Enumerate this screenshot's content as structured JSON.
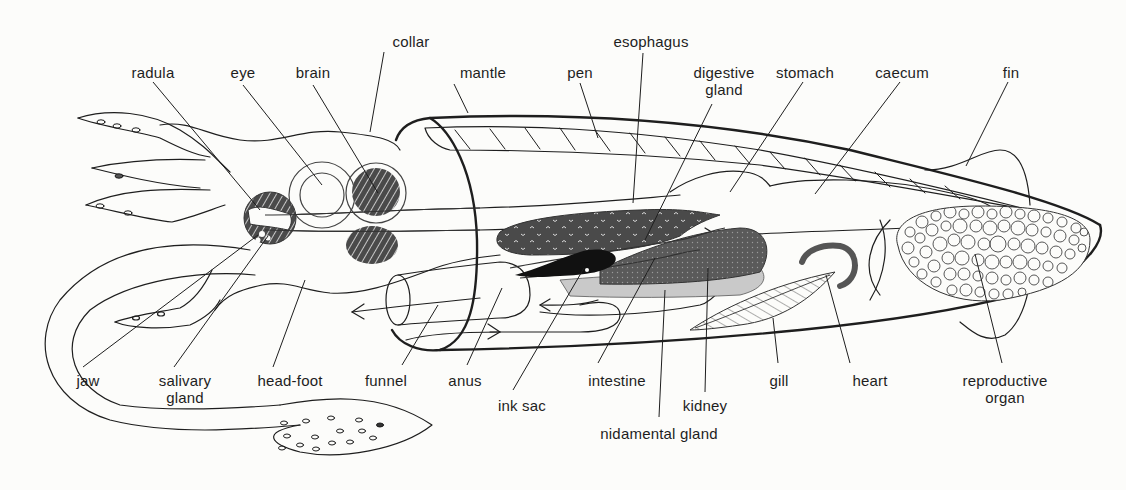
{
  "diagram": {
    "colors": {
      "background": "#fcfcfa",
      "line": "#1e1e1e",
      "dark_organ": "#4a4a4a",
      "ink_sac": "#111111",
      "nidamental": "#c9c9c9",
      "heart": "#555555"
    },
    "labels": {
      "radula": "radula",
      "eye": "eye",
      "brain": "brain",
      "collar": "collar",
      "mantle": "mantle",
      "pen": "pen",
      "esophagus": "esophagus",
      "digestive_gland_1": "digestive",
      "digestive_gland_2": "gland",
      "stomach": "stomach",
      "caecum": "caecum",
      "fin": "fin",
      "jaw": "jaw",
      "salivary_gland_1": "salivary",
      "salivary_gland_2": "gland",
      "head_foot": "head-foot",
      "funnel": "funnel",
      "anus": "anus",
      "ink_sac": "ink sac",
      "intestine": "intestine",
      "kidney": "kidney",
      "nidamental_gland": "nidamental gland",
      "gill": "gill",
      "heart": "heart",
      "reproductive_organ_1": "reproductive",
      "reproductive_organ_2": "organ"
    }
  }
}
